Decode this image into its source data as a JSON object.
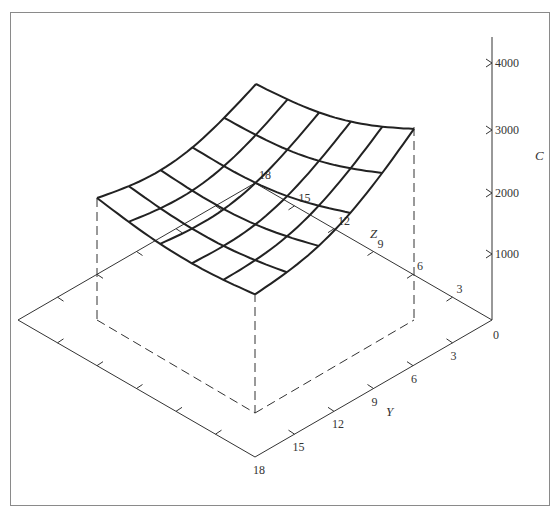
{
  "figure": {
    "type": "3d-surface-wireframe",
    "axes": {
      "C": {
        "label": "C",
        "ticks": [
          "0",
          "1000",
          "2000",
          "3000",
          "4000"
        ]
      },
      "Y": {
        "label": "Y",
        "ticks": [
          "3",
          "6",
          "9",
          "12",
          "15",
          "18"
        ]
      },
      "Z": {
        "label": "Z",
        "ticks": [
          "3",
          "6",
          "9",
          "12",
          "15",
          "18"
        ]
      }
    },
    "origin_label": "0"
  },
  "chart_data": {
    "type": "surface",
    "title": "",
    "xlabel": "Y",
    "ylabel": "Z",
    "zlabel": "C",
    "y_ticks": [
      0,
      3,
      6,
      9,
      12,
      15,
      18
    ],
    "z_ticks": [
      0,
      3,
      6,
      9,
      12,
      15,
      18
    ],
    "c_ticks": [
      0,
      1000,
      2000,
      3000,
      4000
    ],
    "zlim": [
      0,
      4000
    ],
    "grid_lines": 6,
    "surface_shape": "U-shaped trough (convex), minimum along center valley, raised at back and right edges",
    "approx_corner_values": {
      "back_corner_C": 3900,
      "right_corner_C": 3000,
      "left_corner_C": 1900,
      "front_corner_C": 400
    }
  }
}
